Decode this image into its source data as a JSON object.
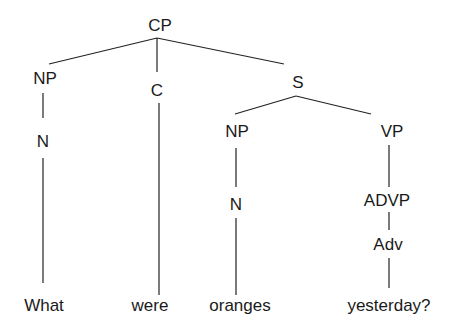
{
  "diagram": {
    "type": "syntax-tree",
    "sentence": "What were oranges yesterday?",
    "nodes": {
      "cp": "CP",
      "np1": "NP",
      "c": "C",
      "s": "S",
      "n1": "N",
      "np2": "NP",
      "vp": "VP",
      "n2": "N",
      "advp": "ADVP",
      "adv": "Adv"
    },
    "words": {
      "w1": "What",
      "w2": "were",
      "w3": "oranges",
      "w4": "yesterday?"
    },
    "edges": [
      [
        "CP",
        "NP"
      ],
      [
        "CP",
        "C"
      ],
      [
        "CP",
        "S"
      ],
      [
        "NP",
        "N"
      ],
      [
        "N",
        "What"
      ],
      [
        "C",
        "were"
      ],
      [
        "S",
        "NP"
      ],
      [
        "S",
        "VP"
      ],
      [
        "NP",
        "N"
      ],
      [
        "N",
        "oranges"
      ],
      [
        "VP",
        "ADVP"
      ],
      [
        "ADVP",
        "Adv"
      ],
      [
        "Adv",
        "yesterday?"
      ]
    ]
  }
}
